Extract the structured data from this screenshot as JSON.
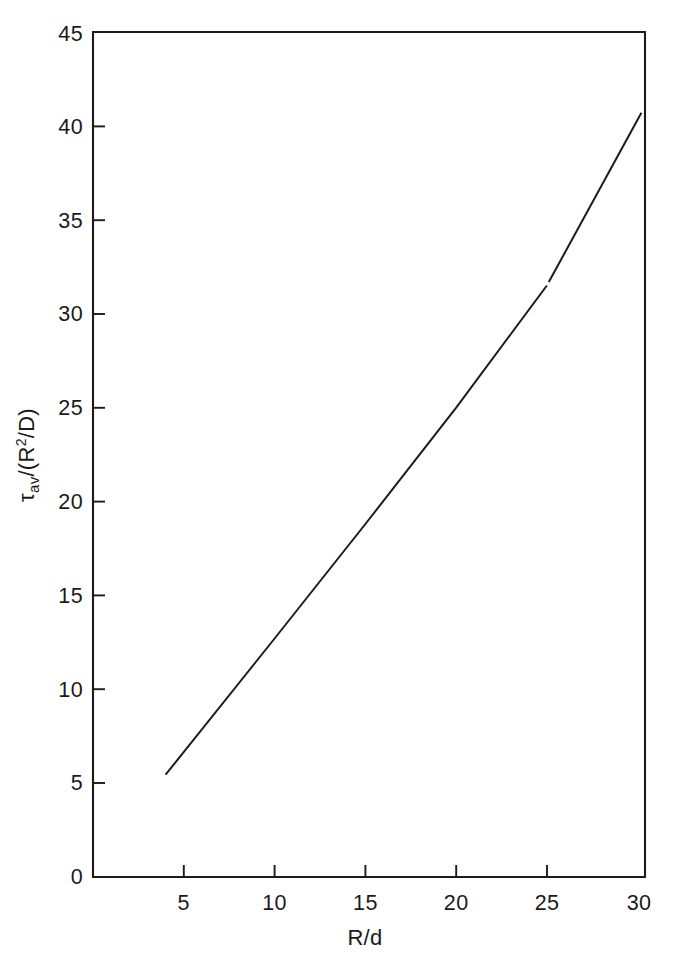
{
  "figure": {
    "background_color": "#ffffff",
    "ink_color": "#1b1b1b"
  },
  "chart_data": {
    "type": "line",
    "title": "",
    "subtitle": "",
    "xlabel": "R/d",
    "ylabel": "τav/(R2/D)",
    "ylabel_parts": {
      "tau": "τ",
      "subscript": "av",
      "slash_open": "/(R",
      "superscript": "2",
      "close": "/D)"
    },
    "xlim": [
      0,
      30.4
    ],
    "ylim": [
      0,
      45
    ],
    "xticks": [
      5,
      10,
      15,
      20,
      25,
      30
    ],
    "yticks": [
      0,
      5,
      10,
      15,
      20,
      25,
      30,
      35,
      40,
      45
    ],
    "xtick_labels": [
      "5",
      "10",
      "15",
      "20",
      "25",
      "30"
    ],
    "ytick_labels": [
      "0",
      "5",
      "10",
      "15",
      "20",
      "25",
      "30",
      "35",
      "40",
      "45"
    ],
    "grid": false,
    "legend": null,
    "legend_position": "none",
    "annotations": [],
    "series": [
      {
        "name": "tau_av vs R/d",
        "style": "solid",
        "color": "#1b1b1b",
        "x": [
          4.0,
          10.0,
          15.0,
          20.0,
          25.0,
          30.2
        ],
        "y": [
          5.45,
          12.7,
          18.8,
          25.0,
          31.5,
          40.7
        ]
      }
    ]
  },
  "axes": {
    "x_axis_name": "R/d",
    "y_axis_name": "tau-av over R-squared over D",
    "frame": "open-left-bottom-box"
  }
}
